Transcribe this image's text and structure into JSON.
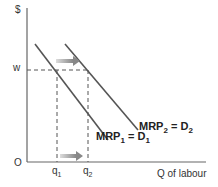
{
  "diagram": {
    "y_axis_label": "$",
    "x_axis_label": "Q of labour",
    "origin_label": "O",
    "wage_label": "w",
    "q1": {
      "base": "q",
      "sub": "1"
    },
    "q2": {
      "base": "q",
      "sub": "2"
    },
    "curve1": {
      "mrp": "MRP",
      "mrp_sub": "1",
      "eq": " = ",
      "d": "D",
      "d_sub": "1"
    },
    "curve2": {
      "mrp": "MRP",
      "mrp_sub": "2",
      "eq": " = ",
      "d": "D",
      "d_sub": "2"
    },
    "colors": {
      "axis": "#666666",
      "curve": "#555555",
      "dashed": "#555555",
      "arrow": "#999999"
    }
  }
}
